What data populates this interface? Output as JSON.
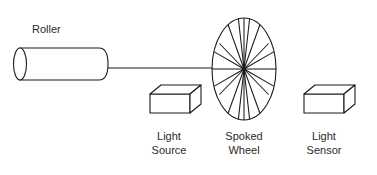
{
  "diagram": {
    "background_color": "#ffffff",
    "line_color": "#1a1a1a",
    "text_color": "#2b2b2b",
    "labels": {
      "roller": "Roller",
      "light_source_line1": "Light",
      "light_source_line2": "Source",
      "spoked_wheel_line1": "Spoked",
      "spoked_wheel_line2": "Wheel",
      "light_sensor_line1": "Light",
      "light_sensor_line2": "Sensor"
    },
    "components": {
      "roller": {
        "name": "Roller",
        "shape": "cylinder",
        "left_cap_center_x": 20,
        "left_cap_center_y": 64,
        "left_cap_rx": 6,
        "left_cap_ry": 16,
        "body_length": 85,
        "right_cap_rounded": true
      },
      "shaft": {
        "name": "Shaft",
        "shape": "line",
        "x1": 108,
        "y1": 68,
        "x2": 243,
        "y2": 68
      },
      "spoked_wheel": {
        "name": "Spoked Wheel",
        "shape": "ellipse-with-radial-spokes",
        "center_x": 244,
        "center_y": 69,
        "rx": 32,
        "ry": 51,
        "spoke_count": 18,
        "hub_radius": 2
      },
      "light_source": {
        "name": "Light Source",
        "shape": "isometric-box",
        "front_x": 150,
        "front_y": 94,
        "front_width": 40,
        "front_height": 19,
        "depth_x": 11,
        "depth_y": -9
      },
      "light_sensor": {
        "name": "Light Sensor",
        "shape": "isometric-box",
        "front_x": 304,
        "front_y": 94,
        "front_width": 40,
        "front_height": 19,
        "depth_x": 11,
        "depth_y": -9
      }
    }
  }
}
